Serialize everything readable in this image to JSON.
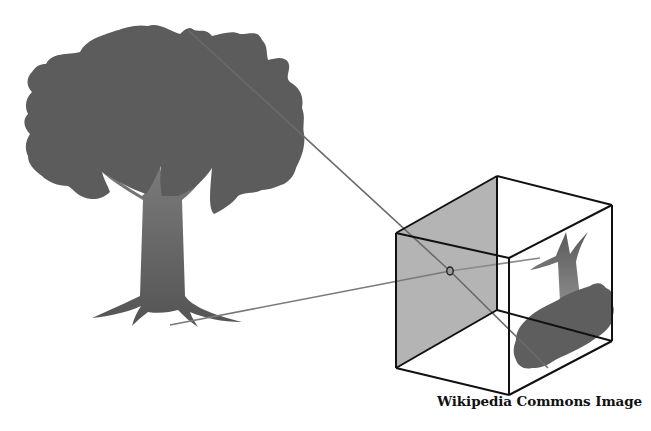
{
  "figure": {
    "caption": "Wikipedia Commons Image",
    "elements": {
      "object": "tree",
      "camera": "box with pinhole",
      "image": "inverted tree projected on back wall"
    },
    "colors": {
      "background": "#ffffff",
      "canopy": "#5c5c5c",
      "trunk_top": "#7a7a7a",
      "trunk_bottom": "#555555",
      "box_face_shaded": "#b4b4b4",
      "box_edge": "#111111",
      "ray": "#6a6a6a",
      "image_canopy": "#5e5e5e",
      "image_trunk": "#7c7c7c"
    }
  }
}
